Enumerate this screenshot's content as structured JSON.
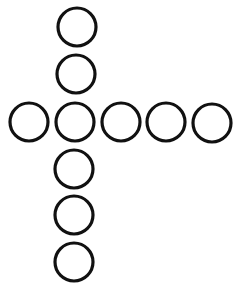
{
  "diagram": {
    "stroke_color": "#111111",
    "fill_color": "#ffffff",
    "radius": 19,
    "stroke_width": 3.2,
    "circles": [
      {
        "cx": 77,
        "cy": 27
      },
      {
        "cx": 76,
        "cy": 74
      },
      {
        "cx": 29,
        "cy": 122
      },
      {
        "cx": 75,
        "cy": 122
      },
      {
        "cx": 121,
        "cy": 122
      },
      {
        "cx": 166,
        "cy": 122
      },
      {
        "cx": 212,
        "cy": 123
      },
      {
        "cx": 74,
        "cy": 169
      },
      {
        "cx": 74,
        "cy": 215
      },
      {
        "cx": 74,
        "cy": 262
      }
    ]
  }
}
